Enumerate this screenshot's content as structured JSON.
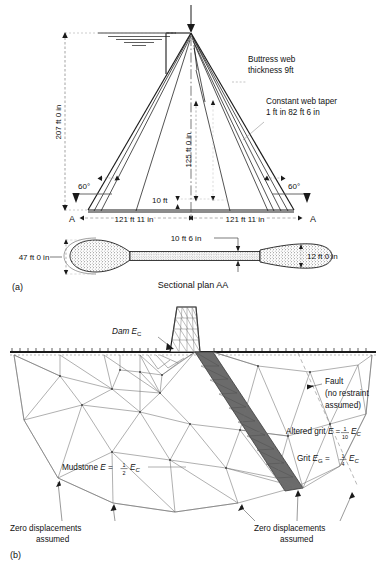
{
  "figure": {
    "panel_a": {
      "caption": "(a)",
      "labels": {
        "height": "207 ft 0 in",
        "web_height": "125 ft 0 in",
        "base_left": "121 ft 11 in",
        "base_right": "121 ft 11 in",
        "base_thickness": "10 ft",
        "angle_left": "60°",
        "angle_right": "60°",
        "buttress_web_line1": "Buttress web",
        "buttress_web_line2": "thickness 9ft",
        "taper_line1": "Constant web taper",
        "taper_line2": "1 ft in 82 ft 6 in",
        "section_mark_left": "A",
        "section_mark_right": "A"
      },
      "plan": {
        "title": "Sectional plan AA",
        "width_left": "47 ft 0 in",
        "web_width": "10 ft 6 in",
        "web_thickness": "12 ft 0 in"
      }
    },
    "panel_b": {
      "caption": "(b)",
      "labels": {
        "dam": "Dam E",
        "dam_sub": "C",
        "fault_line1": "Fault",
        "fault_line2": "(no restraint",
        "fault_line3": "assumed)",
        "altered_grit_prefix": "Altered grit ",
        "altered_grit_E": "E",
        "altered_grit_eq": " = ",
        "altered_grit_num": "1",
        "altered_grit_den": "10",
        "altered_grit_suffix": "E",
        "altered_grit_sub": "C",
        "grit_prefix": "Grit ",
        "grit_E": "E",
        "grit_E_sub": "G",
        "grit_eq": " = ",
        "grit_num": "1",
        "grit_den": "4",
        "grit_suffix": "E",
        "grit_sub": "C",
        "mudstone_prefix": "Mudstone ",
        "mudstone_E": "E",
        "mudstone_eq": " = ",
        "mudstone_num": "1",
        "mudstone_den": "2",
        "mudstone_suffix": "E",
        "mudstone_sub": "C",
        "zero_disp_left_line1": "Zero displacements",
        "zero_disp_left_line2": "assumed",
        "zero_disp_right_line1": "Zero displacements",
        "zero_disp_right_line2": "assumed"
      }
    },
    "colors": {
      "line": "#1a1a1a",
      "mesh": "#6e6e6e",
      "fault_band": "#6b6b6b",
      "dashed": "#9a9a9a",
      "background": "#ffffff"
    }
  }
}
